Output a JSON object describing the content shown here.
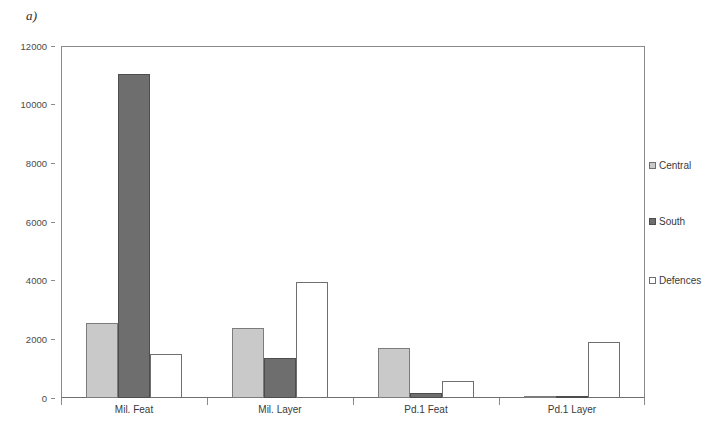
{
  "figure": {
    "label": "a)"
  },
  "chart_data": {
    "type": "bar",
    "title": "",
    "subtitle": "",
    "xlabel": "",
    "ylabel": "",
    "categories": [
      "Mil. Feat",
      "Mil. Layer",
      "Pd.1 Feat",
      "Pd.1 Layer"
    ],
    "series": [
      {
        "name": "Central",
        "color": "#c9c9c9",
        "values": [
          2550,
          2380,
          1700,
          30
        ]
      },
      {
        "name": "South",
        "color": "#6e6e6e",
        "values": [
          11060,
          1380,
          170,
          20
        ]
      },
      {
        "name": "Defences",
        "color": "#ffffff",
        "values": [
          1500,
          3950,
          570,
          1900
        ]
      }
    ],
    "ylim": [
      0,
      12000
    ],
    "yticks": [
      0,
      2000,
      4000,
      6000,
      8000,
      10000,
      12000
    ],
    "ytick_labels": [
      "0",
      "2000",
      "4000",
      "6000",
      "8000",
      "10000",
      "12000"
    ],
    "grid": false,
    "legend_position": "right",
    "legend_entries": [
      "Central",
      "South",
      "Defences"
    ]
  },
  "axis": {
    "frame_color": "#8a8a8a",
    "tick_color": "#8a8a8a",
    "label_color": "#3a3a3a"
  }
}
